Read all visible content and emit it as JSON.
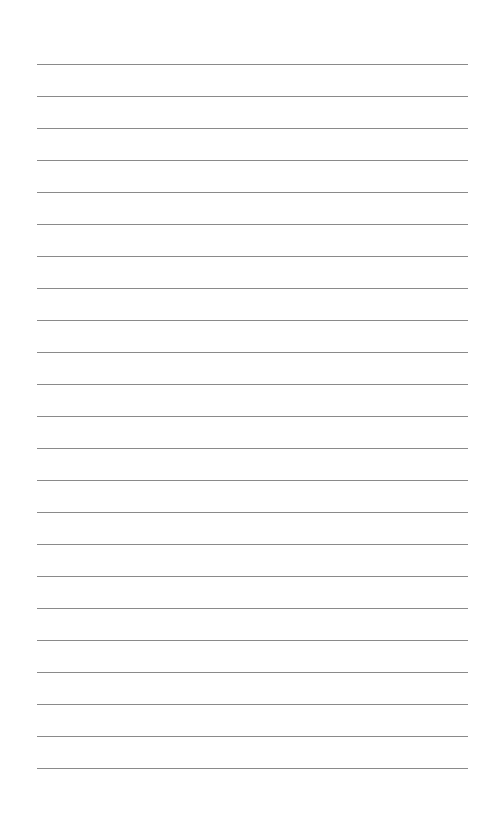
{
  "page": {
    "type": "lined-paper",
    "background_color": "#ffffff",
    "line_color": "#8a8a8a",
    "line_count": 23,
    "line_left": 37,
    "line_right": 468,
    "first_line_y": 64,
    "line_spacing": 32.0
  }
}
